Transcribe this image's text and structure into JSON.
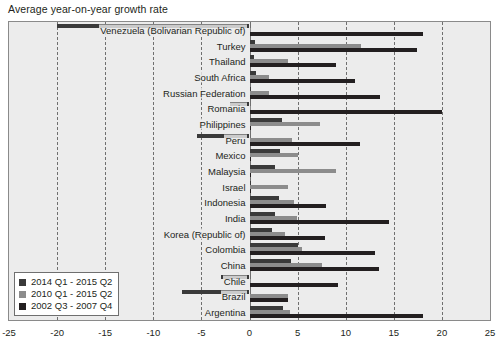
{
  "chart_title": "Average year-on-year growth rate",
  "legend": {
    "position": "bottom-left",
    "items": [
      {
        "label": "2014 Q1 - 2015 Q2",
        "color": "#3a3a3a"
      },
      {
        "label": "2010 Q1 - 2015 Q2",
        "color": "#8c8c8c"
      },
      {
        "label": "2002 Q3 - 2007 Q4",
        "color": "#231f20"
      }
    ]
  },
  "axis": {
    "tick_labels": [
      "-25",
      "-20",
      "-15",
      "-10",
      "-5",
      "0",
      "5",
      "10",
      "15",
      "20",
      "25"
    ],
    "tick_values": [
      -25,
      -20,
      -15,
      -10,
      -5,
      0,
      5,
      10,
      15,
      20,
      25
    ]
  },
  "chart_data": {
    "type": "bar",
    "orientation": "horizontal",
    "title": "Average year-on-year growth rate",
    "xlabel": "",
    "ylabel": "",
    "xlim": [
      -25,
      25
    ],
    "grid": true,
    "grid_axis": "x",
    "legend_position": "bottom-left",
    "categories": [
      "Venezuela (Bolivarian Republic of)",
      "Turkey",
      "Thailand",
      "South Africa",
      "Russian Federation",
      "Romania",
      "Philippines",
      "Peru",
      "Mexico",
      "Malaysia",
      "Israel",
      "Indonesia",
      "India",
      "Korea (Republic of)",
      "Colombia",
      "China",
      "Chile",
      "Brazil",
      "Argentina"
    ],
    "series": [
      {
        "name": "2014 Q1 - 2015 Q2",
        "color": "#3a3a3a",
        "values": [
          -20.0,
          0.6,
          0.5,
          0.7,
          0.0,
          -2.0,
          3.4,
          -5.5,
          3.2,
          2.6,
          0.1,
          3.1,
          2.7,
          2.3,
          5.0,
          4.3,
          -3.0,
          -7.0,
          3.5
        ]
      },
      {
        "name": "2010 Q1 - 2015 Q2",
        "color": "#8c8c8c",
        "values": [
          0.2,
          11.6,
          4.0,
          2.0,
          2.0,
          0.2,
          7.3,
          4.4,
          5.0,
          9.0,
          4.0,
          4.6,
          4.9,
          3.7,
          5.5,
          7.5,
          0.1,
          4.0,
          4.2
        ]
      },
      {
        "name": "2002 Q3 - 2007 Q4",
        "color": "#231f20",
        "values": [
          18.0,
          17.4,
          9.0,
          11.0,
          13.6,
          20.0,
          0.1,
          11.5,
          0.2,
          0.1,
          0.1,
          8.0,
          14.5,
          7.8,
          13.0,
          13.5,
          9.2,
          4.0,
          18.0
        ]
      }
    ]
  }
}
